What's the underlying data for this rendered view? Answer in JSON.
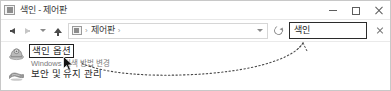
{
  "window": {
    "title": "색인 - 제어판",
    "title_icon": "control-panel-icon",
    "controls": {
      "minimize_label": "─",
      "maximize_label": "□",
      "close_label": "✕"
    }
  },
  "navbar": {
    "back_icon": "arrow-left-icon",
    "forward_icon": "arrow-right-icon",
    "recent_icon": "chevron-down-icon",
    "up_icon": "arrow-up-icon",
    "breadcrumb": {
      "icon": "control-panel-icon",
      "separator": "›",
      "items": [
        {
          "label": "제어판"
        }
      ],
      "dropdown_icon": "chevron-down-icon"
    },
    "refresh_icon": "refresh-icon",
    "search": {
      "value": "색인",
      "placeholder": "제어판 검색",
      "clear_icon": "close-icon"
    }
  },
  "content": {
    "results": [
      {
        "icon": "indexing-options-icon",
        "title": "색인 옵션",
        "subtitle": "Windows 검색 방법 변경",
        "highlighted": true
      },
      {
        "icon": "security-maintenance-icon",
        "title": "보안 및 유지 관리",
        "subtitle": "",
        "highlighted": false
      }
    ]
  },
  "annotation": {
    "type": "dotted-curve",
    "color": "#4a4a4a",
    "description": "검색 상자에서 색인 옵션 결과로 연결되는 점선"
  },
  "cursor": {
    "type": "arrow-pointer",
    "x": 62,
    "y": 55
  }
}
